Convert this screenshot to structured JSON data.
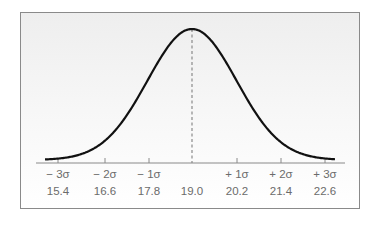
{
  "chart_data": {
    "type": "line",
    "title": "",
    "subtitle": "Normal distribution curve",
    "xlabel": "",
    "ylabel": "",
    "mean": 19.0,
    "sd": 1.2,
    "x_ticks": [
      {
        "sigma": "− 3σ",
        "value": "15.4"
      },
      {
        "sigma": "− 2σ",
        "value": "16.6"
      },
      {
        "sigma": "− 1σ",
        "value": "17.8"
      },
      {
        "sigma": "",
        "value": "19.0"
      },
      {
        "sigma": "+ 1σ",
        "value": "20.2"
      },
      {
        "sigma": "+ 2σ",
        "value": "21.4"
      },
      {
        "sigma": "+ 3σ",
        "value": "22.6"
      }
    ],
    "x": [
      15.4,
      16.6,
      17.8,
      19.0,
      20.2,
      21.4,
      22.6
    ],
    "series": [
      {
        "name": "normal density",
        "values": [
          0.011,
          0.135,
          0.607,
          1.0,
          0.607,
          0.135,
          0.011
        ]
      }
    ],
    "annotations": [
      "dashed vertical line at mean 19.0"
    ],
    "grid": false,
    "legend": "none",
    "colors": {
      "curve": "#111111",
      "axis": "#8a8a8a",
      "labels": "#6b6b6b",
      "mean_line": "#8a8a8a"
    }
  }
}
